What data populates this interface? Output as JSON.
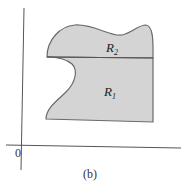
{
  "figure": {
    "caption": "(b)",
    "origin_label": "0",
    "regions": [
      {
        "name": "R",
        "subscript": "2"
      },
      {
        "name": "R",
        "subscript": "1"
      }
    ],
    "colors": {
      "fill": "#d4d4d4",
      "outline": "#6a6a6a",
      "axes": "#555555"
    }
  }
}
